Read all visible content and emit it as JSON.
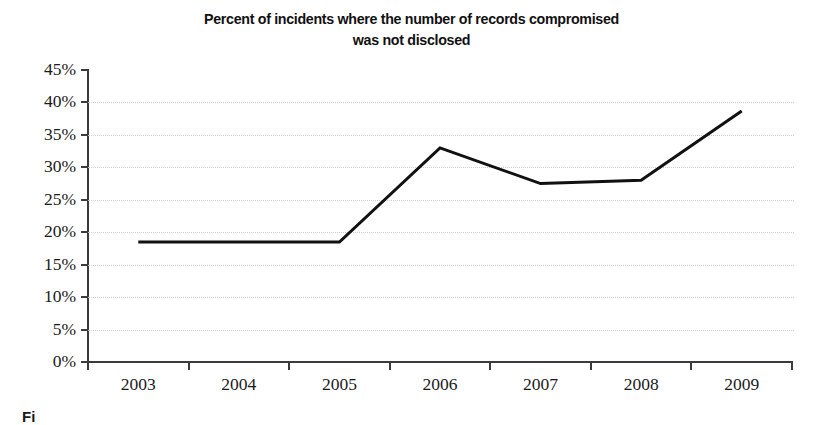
{
  "chart_data": {
    "type": "line",
    "title": "Percent of incidents where the number of records compromised\nwas not disclosed",
    "title_line1": "Percent of incidents where the number of records compromised",
    "title_line2": "was not disclosed",
    "xlabel": "",
    "ylabel": "",
    "categories": [
      "2003",
      "2004",
      "2005",
      "2006",
      "2007",
      "2008",
      "2009"
    ],
    "values": [
      18.5,
      18.5,
      18.5,
      33.0,
      27.5,
      28.0,
      38.7
    ],
    "value_labels": [
      "18.5%",
      "18.5%",
      "18.5%",
      "33%",
      "27.5%",
      "28%",
      "38.7%"
    ],
    "ylim": [
      0,
      45
    ],
    "ytick_values": [
      0,
      5,
      10,
      15,
      20,
      25,
      30,
      35,
      40,
      45
    ],
    "ytick_labels": [
      "0%",
      "5%",
      "10%",
      "15%",
      "20%",
      "25%",
      "30%",
      "35%",
      "40%",
      "45%"
    ],
    "grid": true,
    "grid_axis": "y",
    "grid_style": "dotted",
    "legend": false,
    "legend_position": "none",
    "series": [
      {
        "name": "Percent not disclosed",
        "values": [
          18.5,
          18.5,
          18.5,
          33.0,
          27.5,
          28.0,
          38.7
        ],
        "color": "#111111",
        "line_width": 3,
        "markers": false
      }
    ]
  },
  "colors": {
    "line": "#111111",
    "axis": "#3b3b3b",
    "grid": "#c9c9c9",
    "text": "#1a1a1a",
    "background": "#ffffff"
  },
  "caption": {
    "fragment": "Fi"
  }
}
